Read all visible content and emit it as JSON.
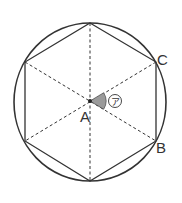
{
  "figure": {
    "colors": {
      "stroke": "#333333",
      "angle_fill": "#9a9a9a",
      "background": "#ffffff"
    },
    "labels": {
      "center": "A",
      "vertex_upper_right": "C",
      "vertex_lower_right": "B",
      "angle_mark": "ア"
    }
  }
}
